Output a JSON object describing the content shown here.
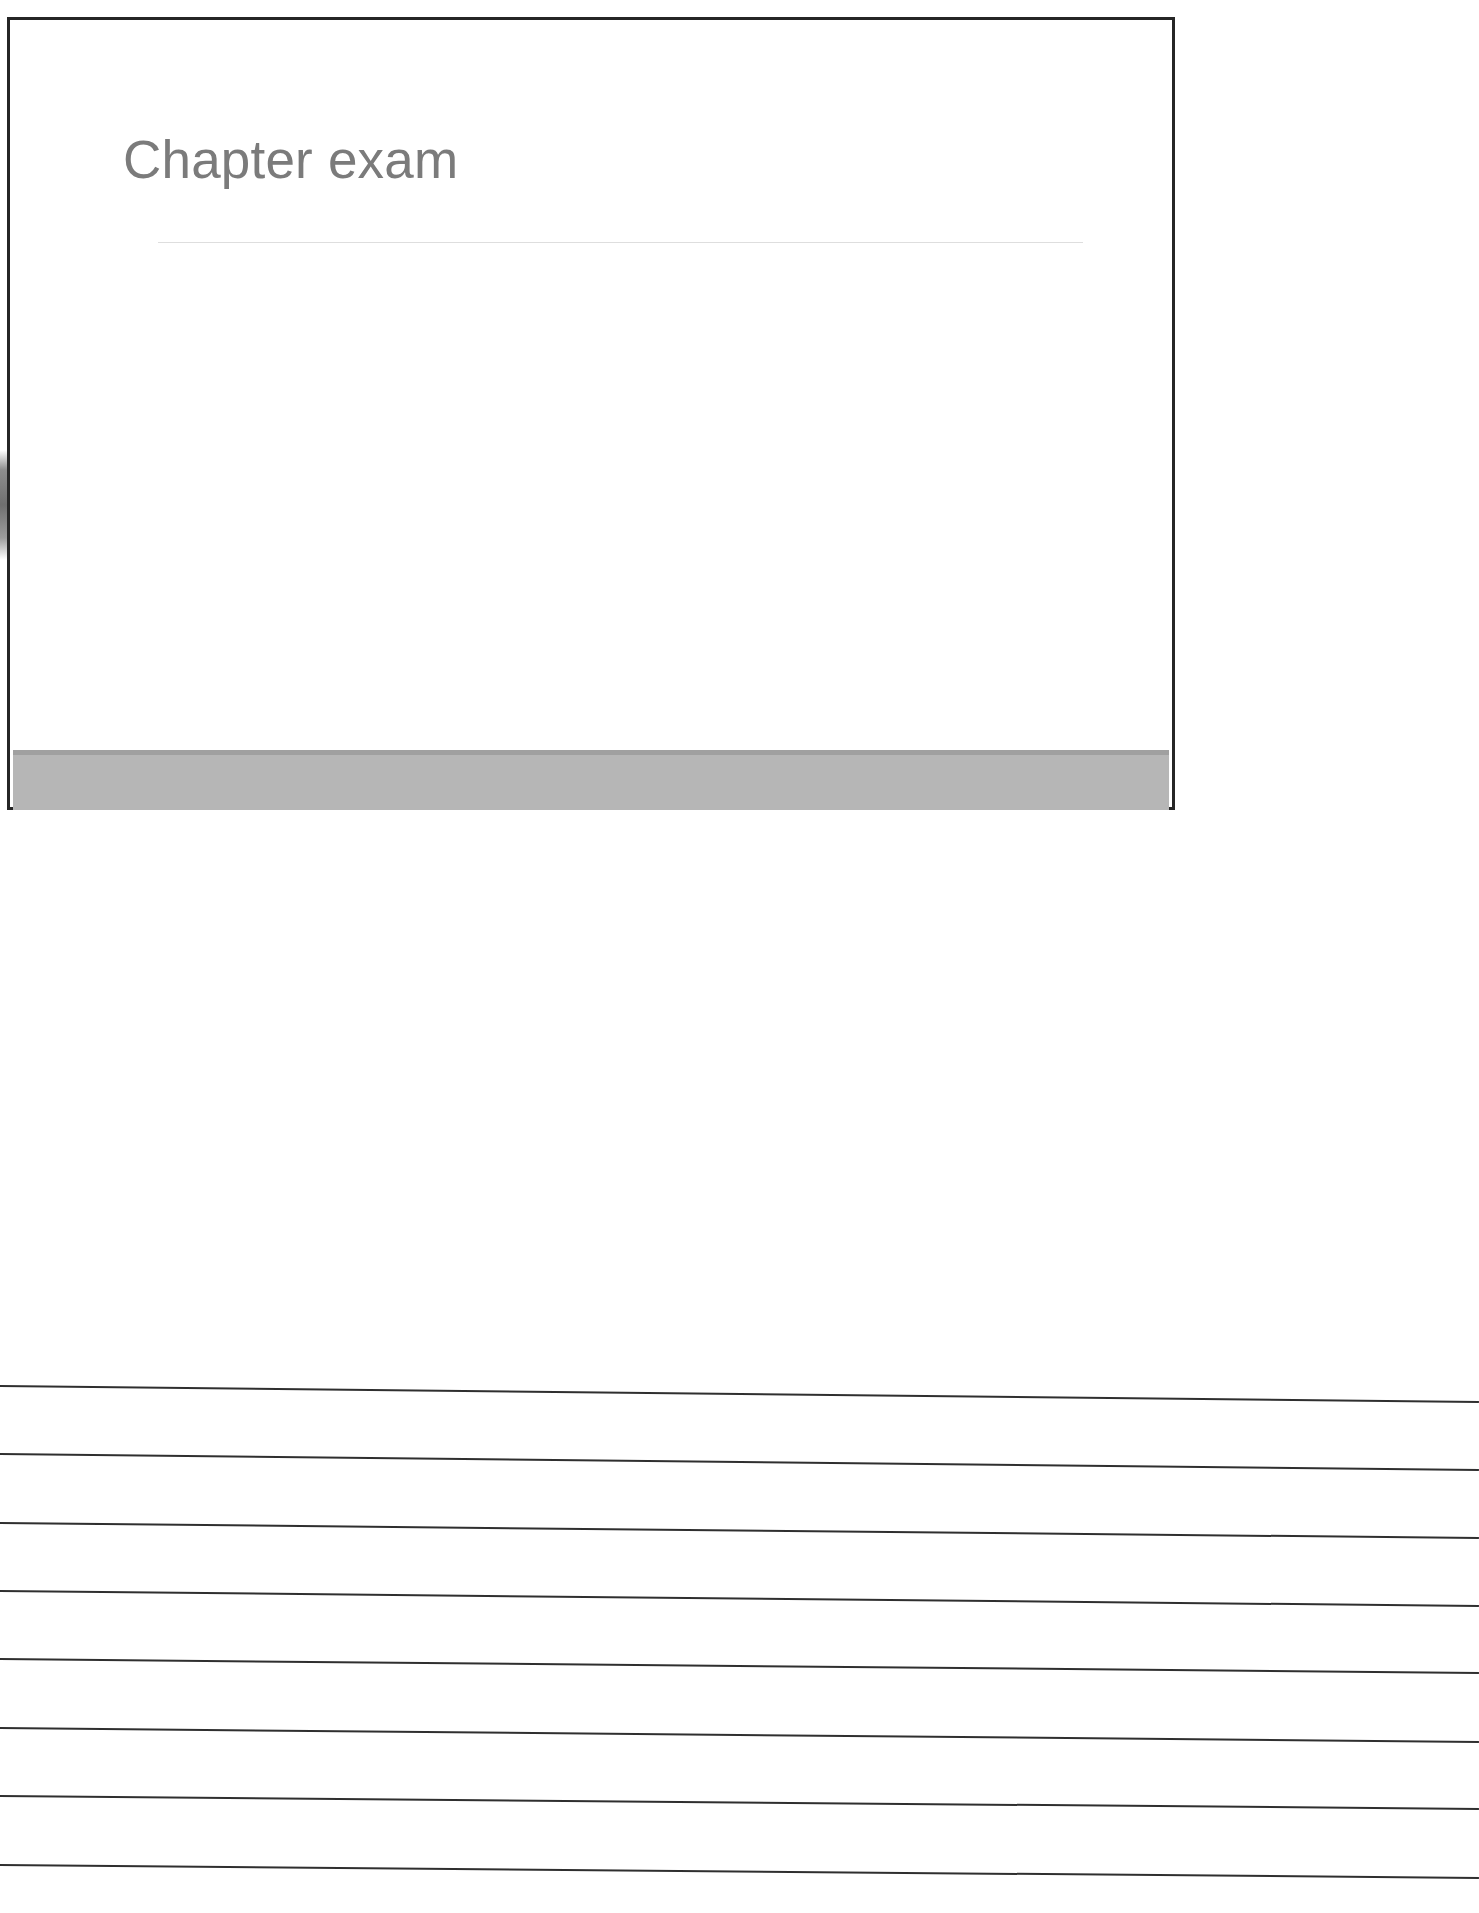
{
  "page": {
    "kind": "scanned-presentation-handout",
    "width": 1479,
    "height": 1913,
    "background_color": "#ffffff"
  },
  "slide": {
    "title": "Chapter exam",
    "title_color": "#7b7b7b",
    "title_rule_color": "#dedede",
    "border_color": "#262626",
    "body_color": "#ffffff",
    "footer_band_color": "#b6b6b6",
    "footer_band_edge_color": "#a0a0a0",
    "body_text": ""
  },
  "notes": {
    "label": "ruled writing lines",
    "line_color": "#2f2f2f",
    "line_count": 8,
    "lines": [
      {
        "y": 45,
        "tilt_deg": 0.62
      },
      {
        "y": 113,
        "tilt_deg": 0.62
      },
      {
        "y": 182,
        "tilt_deg": 0.58
      },
      {
        "y": 250,
        "tilt_deg": 0.58
      },
      {
        "y": 318,
        "tilt_deg": 0.54
      },
      {
        "y": 387,
        "tilt_deg": 0.54
      },
      {
        "y": 455,
        "tilt_deg": 0.5
      },
      {
        "y": 524,
        "tilt_deg": 0.5
      }
    ]
  },
  "artifacts": {
    "left_margin_smudge": "scanner-edge-shadow"
  }
}
